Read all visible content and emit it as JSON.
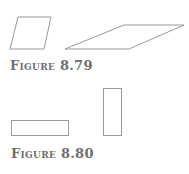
{
  "figures": [
    {
      "caption": "Figure 8.79",
      "shapes": [
        {
          "name": "small-parallelogram"
        },
        {
          "name": "wide-parallelogram"
        }
      ]
    },
    {
      "caption": "Figure 8.80",
      "shapes": [
        {
          "name": "horizontal-rectangle"
        },
        {
          "name": "vertical-rectangle"
        }
      ]
    }
  ],
  "colors": {
    "stroke": "#9a9a9a",
    "caption": "#6f6f6f"
  }
}
